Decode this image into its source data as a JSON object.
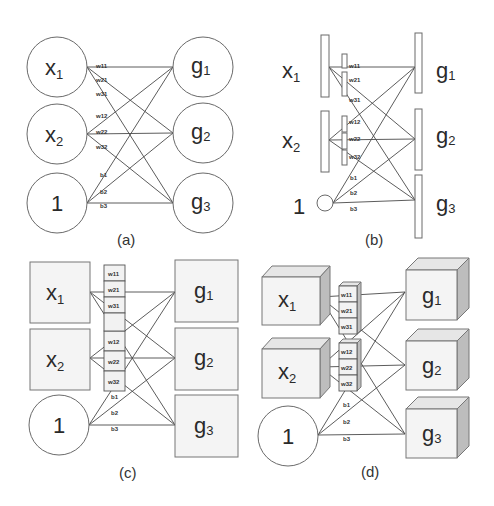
{
  "figure": {
    "panels": [
      {
        "id": "a",
        "caption": "(a)",
        "input_style": "circle",
        "output_style": "circle",
        "inputs": [
          {
            "main": "x",
            "sub": "1"
          },
          {
            "main": "x",
            "sub": "2"
          },
          {
            "main": "1",
            "sub": ""
          }
        ],
        "outputs": [
          {
            "main": "g",
            "sub": "1"
          },
          {
            "main": "g",
            "sub": "2"
          },
          {
            "main": "g",
            "sub": "3"
          }
        ],
        "weights": [
          "w11",
          "w21",
          "w31",
          "w12",
          "w22",
          "w32"
        ],
        "biases": [
          "b1",
          "b2",
          "b3"
        ]
      },
      {
        "id": "b",
        "caption": "(b)",
        "input_style": "bar",
        "output_style": "bar",
        "inputs": [
          {
            "main": "x",
            "sub": "1"
          },
          {
            "main": "x",
            "sub": "2"
          },
          {
            "main": "1",
            "sub": ""
          }
        ],
        "outputs": [
          {
            "main": "g",
            "sub": "1"
          },
          {
            "main": "g",
            "sub": "2"
          },
          {
            "main": "g",
            "sub": "3"
          }
        ],
        "weights": [
          "w11",
          "w21",
          "w31",
          "w12",
          "w22",
          "w32"
        ],
        "biases": [
          "b1",
          "b2",
          "b3"
        ]
      },
      {
        "id": "c",
        "caption": "(c)",
        "input_style": "square",
        "output_style": "square",
        "inputs": [
          {
            "main": "x",
            "sub": "1"
          },
          {
            "main": "x",
            "sub": "2"
          },
          {
            "main": "1",
            "sub": ""
          }
        ],
        "outputs": [
          {
            "main": "g",
            "sub": "1"
          },
          {
            "main": "g",
            "sub": "2"
          },
          {
            "main": "g",
            "sub": "3"
          }
        ],
        "weights": [
          "w11",
          "w21",
          "w31",
          "w12",
          "w22",
          "w32"
        ],
        "biases": [
          "b1",
          "b2",
          "b3"
        ]
      },
      {
        "id": "d",
        "caption": "(d)",
        "input_style": "cube",
        "output_style": "cube",
        "inputs": [
          {
            "main": "x",
            "sub": "1"
          },
          {
            "main": "x",
            "sub": "2"
          },
          {
            "main": "1",
            "sub": ""
          }
        ],
        "outputs": [
          {
            "main": "g",
            "sub": "1"
          },
          {
            "main": "g",
            "sub": "2"
          },
          {
            "main": "g",
            "sub": "3"
          }
        ],
        "weights": [
          "w11",
          "w21",
          "w31",
          "w12",
          "w22",
          "w32"
        ],
        "biases": [
          "b1",
          "b2",
          "b3"
        ]
      }
    ]
  }
}
